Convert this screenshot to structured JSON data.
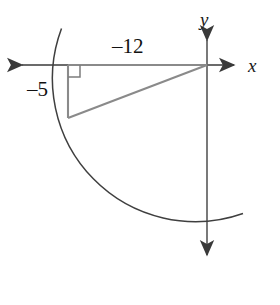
{
  "figure": {
    "type": "geometry-diagram",
    "canvas": {
      "width": 280,
      "height": 305,
      "background": "#ffffff"
    },
    "axes": {
      "x_label": "x",
      "y_label": "y",
      "origin": {
        "x": 207,
        "y": 65
      },
      "color": "#555555",
      "x_axis": {
        "from_x": 15,
        "to_x": 240,
        "y": 65,
        "arrow_left": true,
        "arrow_right": true
      },
      "y_axis": {
        "x": 207,
        "from_y": 33,
        "to_y": 262,
        "arrow_up": true,
        "arrow_down": true
      }
    },
    "triangle": {
      "color": "#7d7d7d",
      "vertices": {
        "origin": {
          "x": 207,
          "y": 65
        },
        "foot": {
          "x": 68,
          "y": 65
        },
        "point": {
          "x": 68,
          "y": 118
        }
      },
      "adjacent_label": "–12",
      "opposite_label": "–5",
      "right_angle_marker": {
        "x": 68,
        "y": 65,
        "size": 12,
        "corner": "down-right"
      }
    },
    "arc": {
      "color": "#3a3a3a",
      "center": {
        "x": 207,
        "y": 65
      },
      "radius": 143,
      "start_point": {
        "x": 61,
        "y": 28
      },
      "end_point": {
        "x": 243,
        "y": 213
      },
      "description": "circular arc of radius 13 through the terminal point"
    },
    "values": {
      "x_leg": -12,
      "y_leg": -5,
      "hypotenuse": 13,
      "quadrant": 3
    }
  }
}
